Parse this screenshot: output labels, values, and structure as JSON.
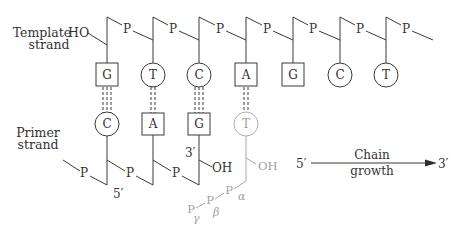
{
  "labels": {
    "template_strand": [
      "Template",
      "strand"
    ],
    "primer_strand": [
      "Primer",
      "strand"
    ],
    "template_ho": "HO",
    "primer_5prime": "5′",
    "primer_3prime": "3′",
    "primer_oh": "OH",
    "incoming_oh": "OH",
    "phosphate": "P",
    "alpha": "α",
    "beta": "β",
    "gamma": "γ"
  },
  "template_bases": [
    {
      "letter": "G",
      "shape": "square"
    },
    {
      "letter": "T",
      "shape": "circle"
    },
    {
      "letter": "C",
      "shape": "circle"
    },
    {
      "letter": "A",
      "shape": "square"
    },
    {
      "letter": "G",
      "shape": "square"
    },
    {
      "letter": "C",
      "shape": "circle"
    },
    {
      "letter": "T",
      "shape": "circle"
    }
  ],
  "primer_bases": [
    {
      "letter": "C",
      "shape": "circle",
      "hbonds": 3
    },
    {
      "letter": "A",
      "shape": "square",
      "hbonds": 2
    },
    {
      "letter": "G",
      "shape": "square",
      "hbonds": 3
    },
    {
      "letter": "T",
      "shape": "circle",
      "hbonds": 2,
      "incoming": true
    }
  ],
  "chain_growth": {
    "from": "5′",
    "to": "3′",
    "label": [
      "Chain",
      "growth"
    ]
  },
  "colors": {
    "ink": "#3a3a3a",
    "incoming_nucleotide": "#a8a8a8",
    "background": "#ffffff"
  }
}
